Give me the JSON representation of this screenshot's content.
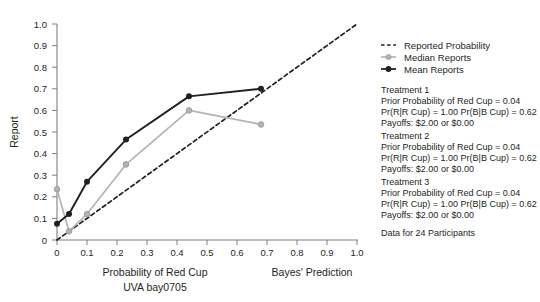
{
  "chart_data": {
    "type": "line",
    "title": "",
    "xlabel": "Probability of Red Cup",
    "xlabel_sub": "UVA bay0705",
    "xlabel_right": "Bayes' Prediction",
    "ylabel": "Report",
    "xlim": [
      0,
      1.0
    ],
    "ylim": [
      0,
      1.0
    ],
    "grid": false,
    "legend_position": "top-right",
    "xticks": [
      "0",
      "0.1",
      "0.2",
      "0.3",
      "0.4",
      "0.5",
      "0.6",
      "0.7",
      "0.8",
      "0.9",
      "1.0"
    ],
    "xtick_values": [
      0,
      0.1,
      0.2,
      0.3,
      0.4,
      0.5,
      0.6,
      0.7,
      0.8,
      0.9,
      1.0
    ],
    "yticks": [
      "0",
      "0.1",
      "0.2",
      "0.3",
      "0.4",
      "0.5",
      "0.6",
      "0.7",
      "0.8",
      "0.9",
      "1.0"
    ],
    "ytick_values": [
      0,
      0.1,
      0.2,
      0.3,
      0.4,
      0.5,
      0.6,
      0.7,
      0.8,
      0.9,
      1.0
    ],
    "series": [
      {
        "name": "Reported Probability",
        "style": "dashed",
        "color": "#231f20",
        "markers": false,
        "x": [
          0,
          1.0
        ],
        "y": [
          0,
          1.0
        ]
      },
      {
        "name": "Median Reports",
        "style": "solid",
        "color": "#b3b3b3",
        "markers": true,
        "x": [
          0,
          0.04,
          0.1,
          0.23,
          0.44,
          0.68
        ],
        "y": [
          0.235,
          0.04,
          0.12,
          0.35,
          0.6,
          0.535
        ]
      },
      {
        "name": "Mean Reports",
        "style": "solid",
        "color": "#231f20",
        "markers": true,
        "x": [
          0,
          0.04,
          0.1,
          0.23,
          0.44,
          0.68
        ],
        "y": [
          0.075,
          0.12,
          0.27,
          0.465,
          0.665,
          0.7
        ]
      }
    ]
  },
  "legend": {
    "items": [
      {
        "label": "Reported Probability",
        "marker": "dashed-line",
        "color": "#231f20"
      },
      {
        "label": "Median Reports",
        "marker": "line-with-circle",
        "color": "#b3b3b3"
      },
      {
        "label": "Mean Reports",
        "marker": "line-with-circle",
        "color": "#231f20"
      }
    ]
  },
  "annotations": {
    "blocks": [
      {
        "heading": "Treatment 1",
        "lines": [
          "Prior Probability of Red Cup = 0.04",
          "Pr(R|R Cup) = 1.00 Pr(B|B Cup) = 0.62",
          "Payoffs: $2.00 or $0.00"
        ]
      },
      {
        "heading": "Treatment 2",
        "lines": [
          "Prior Probability of Red Cup = 0.04",
          "Pr(R|R Cup) = 1.00 Pr(B|B Cup) = 0.62",
          "Payoffs: $2.00 or $0.00"
        ]
      },
      {
        "heading": "Treatment 3",
        "lines": [
          "Prior Probability of Red Cup = 0.04",
          "Pr(R|R Cup) = 1.00 Pr(B|B Cup) = 0.62",
          "Payoffs: $2.00 or $0.00"
        ]
      }
    ],
    "footer": "Data for 24 Participants"
  }
}
